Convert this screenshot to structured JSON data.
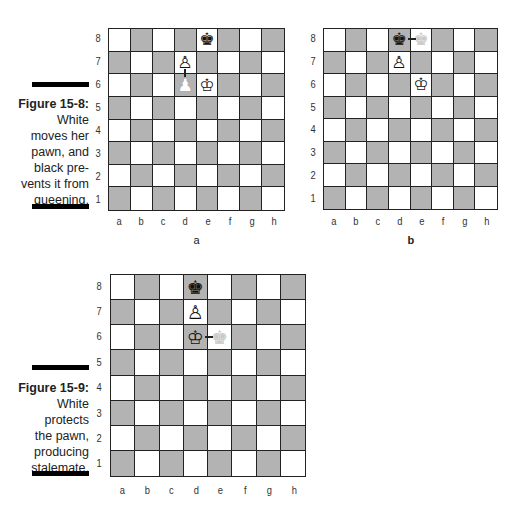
{
  "figures": [
    {
      "id": "figure-15-8",
      "title": "Figure 15-8:",
      "caption_lines": [
        "White",
        "moves her",
        "pawn, and",
        "black pre-",
        "vents it from",
        "queening."
      ]
    },
    {
      "id": "figure-15-9",
      "title": "Figure 15-9:",
      "caption_lines": [
        "White",
        "protects",
        "the pawn,",
        "producing",
        "stalemate."
      ]
    }
  ],
  "files": [
    "a",
    "b",
    "c",
    "d",
    "e",
    "f",
    "g",
    "h"
  ],
  "ranks": [
    "8",
    "7",
    "6",
    "5",
    "4",
    "3",
    "2",
    "1"
  ],
  "colors": {
    "light_square": "#ffffff",
    "dark_square": "#b3b3b3",
    "border": "#222222"
  },
  "boards": [
    {
      "name": "board-a",
      "sub_caption": "a",
      "pieces": [
        {
          "square": "e8",
          "piece": "black-king",
          "glyph": "♚",
          "style": "normal"
        },
        {
          "square": "d7",
          "piece": "white-pawn",
          "glyph": "♙",
          "style": "normal"
        },
        {
          "square": "d6",
          "piece": "white-pawn-previous",
          "glyph": "♟",
          "style": "ghost-light"
        },
        {
          "square": "e6",
          "piece": "white-king",
          "glyph": "♔",
          "style": "normal"
        }
      ],
      "arrows": [
        {
          "from": "d6",
          "to": "d7",
          "direction": "up"
        }
      ]
    },
    {
      "name": "board-b",
      "sub_caption": "b",
      "pieces": [
        {
          "square": "d8",
          "piece": "black-king",
          "glyph": "♚",
          "style": "normal"
        },
        {
          "square": "e8",
          "piece": "black-king-previous",
          "glyph": "♚",
          "style": "ghost"
        },
        {
          "square": "d7",
          "piece": "white-pawn",
          "glyph": "♙",
          "style": "normal"
        },
        {
          "square": "e6",
          "piece": "white-king",
          "glyph": "♔",
          "style": "normal"
        }
      ],
      "arrows": [
        {
          "from": "e8",
          "to": "d8",
          "direction": "left"
        }
      ]
    },
    {
      "name": "board-c",
      "sub_caption": "",
      "pieces": [
        {
          "square": "d8",
          "piece": "black-king",
          "glyph": "♚",
          "style": "normal"
        },
        {
          "square": "d7",
          "piece": "white-pawn",
          "glyph": "♙",
          "style": "normal"
        },
        {
          "square": "d6",
          "piece": "white-king",
          "glyph": "♔",
          "style": "normal"
        },
        {
          "square": "e6",
          "piece": "white-king-previous",
          "glyph": "♚",
          "style": "ghost"
        }
      ],
      "arrows": [
        {
          "from": "e6",
          "to": "d6",
          "direction": "left"
        }
      ]
    }
  ]
}
